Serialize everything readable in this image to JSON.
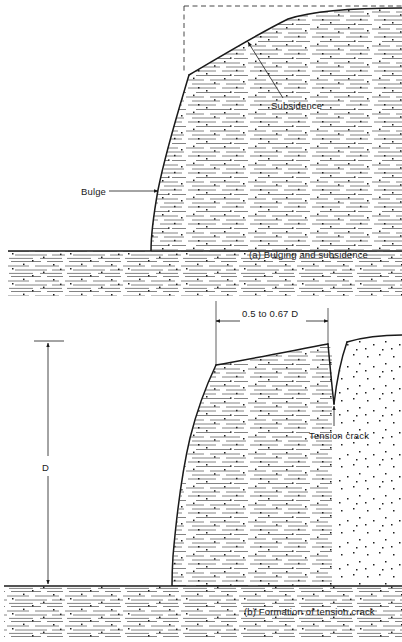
{
  "figure": {
    "kind": "geotechnical-cross-section-diagram",
    "background_color": "#ffffff",
    "line_color": "#1a1a1a",
    "hatch_color": "#555555",
    "panels": [
      {
        "id": "a",
        "caption": "(a) Bulging and subsidence",
        "annotations": [
          {
            "name": "subsidence",
            "label": "Subsidence"
          },
          {
            "name": "bulge",
            "label": "Bulge"
          }
        ]
      },
      {
        "id": "b",
        "caption": "(b) Formation of tension crack",
        "annotations": [
          {
            "name": "tension-crack",
            "label": "Tension crack"
          }
        ],
        "dimensions": [
          {
            "name": "wedge-width",
            "label": "0.5 to 0.67 D",
            "orientation": "horizontal"
          },
          {
            "name": "slope-depth",
            "label": "D",
            "orientation": "vertical"
          }
        ]
      }
    ]
  },
  "captions": {
    "panel_a": "(a) Bulging and subsidence",
    "panel_b": "(b) Formation of tension crack"
  },
  "labels": {
    "subsidence": "Subsidence",
    "bulge": "Bulge",
    "tension_crack": "Tension crack",
    "dim_wedge_width": "0.5 to 0.67 D",
    "dim_depth": "D"
  }
}
